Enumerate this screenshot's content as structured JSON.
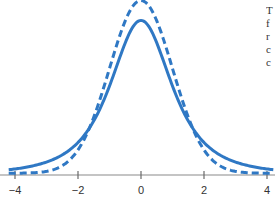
{
  "chart_data": {
    "type": "line",
    "title": "",
    "xlabel": "",
    "ylabel": "",
    "xlim": [
      -4.1,
      4.1
    ],
    "x_ticks": [
      -4,
      -2,
      0,
      2,
      4
    ],
    "x_tick_labels": [
      "−4",
      "−2",
      "0",
      "2",
      "4"
    ],
    "grid": false,
    "legend": "none",
    "series": [
      {
        "name": "standard normal",
        "style": "dashed",
        "color": "#2f78c4",
        "x": [
          -4,
          -3.5,
          -3,
          -2.5,
          -2,
          -1.5,
          -1,
          -0.5,
          0,
          0.5,
          1,
          1.5,
          2,
          2.5,
          3,
          3.5,
          4
        ],
        "values": [
          0.0001,
          0.0009,
          0.0044,
          0.0175,
          0.054,
          0.1295,
          0.242,
          0.3521,
          0.3989,
          0.3521,
          0.242,
          0.1295,
          0.054,
          0.0175,
          0.0044,
          0.0009,
          0.0001
        ]
      },
      {
        "name": "t distribution (heavier tails)",
        "style": "solid",
        "color": "#2f78c4",
        "x": [
          -4,
          -3.5,
          -3,
          -2.5,
          -2,
          -1.5,
          -1,
          -0.5,
          0,
          0.5,
          1,
          1.5,
          2,
          2.5,
          3,
          3.5,
          4
        ],
        "values": [
          0.019,
          0.026,
          0.036,
          0.052,
          0.085,
          0.135,
          0.21,
          0.3,
          0.357,
          0.3,
          0.21,
          0.135,
          0.085,
          0.052,
          0.036,
          0.026,
          0.019
        ]
      }
    ]
  },
  "axis": {
    "ticks": [
      {
        "value": -4,
        "label": "−4"
      },
      {
        "value": -2,
        "label": "−2"
      },
      {
        "value": 0,
        "label": "0"
      },
      {
        "value": 2,
        "label": "2"
      },
      {
        "value": 4,
        "label": "4"
      }
    ]
  },
  "side_text": {
    "lines": [
      "T",
      "f",
      "r",
      "c",
      "c"
    ]
  }
}
